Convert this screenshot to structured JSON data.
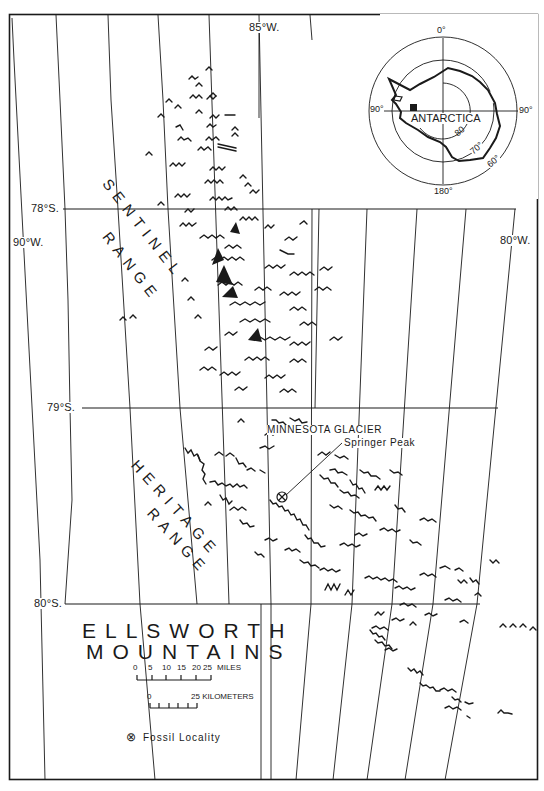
{
  "map": {
    "title_line1": "ELLSWORTH",
    "title_line2": "MOUNTAINS",
    "ranges": [
      {
        "name": "SENTINEL",
        "line2": "RANGE"
      },
      {
        "name": "HERITAGE",
        "line2": "RANGE"
      }
    ],
    "features": {
      "glacier": "MINNESOTA GLACIER",
      "peak": "Springer Peak"
    },
    "graticule": {
      "meridians": [
        "90°W.",
        "85°W.",
        "80°W."
      ],
      "parallels": [
        "78°S.",
        "79°S.",
        "80°S."
      ]
    },
    "scale_miles": {
      "ticks": [
        "0",
        "5",
        "10",
        "15",
        "20",
        "25"
      ],
      "unit": "MILES"
    },
    "scale_km": {
      "ticks": [
        "0",
        "25"
      ],
      "unit": "KILOMETERS"
    },
    "legend": {
      "symbol": "⊗",
      "label": "Fossil Locality"
    },
    "inset": {
      "label": "ANTARCTICA",
      "longitudes": [
        "0°",
        "90°",
        "180°",
        "90°"
      ],
      "latitudes": [
        "80",
        "70°",
        "60°"
      ]
    },
    "colors": {
      "ink": "#1a1a1a",
      "paper": "#ffffff"
    }
  }
}
